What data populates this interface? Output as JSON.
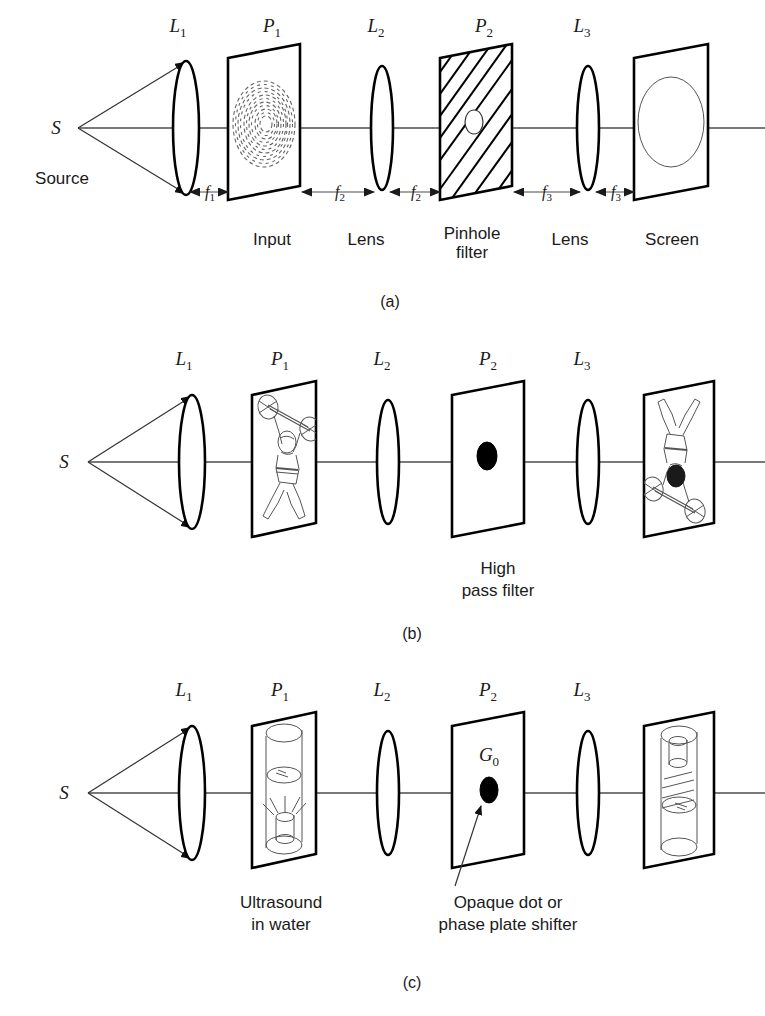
{
  "figure": {
    "background_color": "#ffffff",
    "ink_color": "#000000",
    "axis_color": "#4d4d4d"
  },
  "panels": [
    {
      "id": "a",
      "caption": "(a)",
      "source_label": "S",
      "source_name": "Source",
      "top_labels": [
        {
          "base": "L",
          "sub": "1"
        },
        {
          "base": "P",
          "sub": "1"
        },
        {
          "base": "L",
          "sub": "2"
        },
        {
          "base": "P",
          "sub": "2"
        },
        {
          "base": "L",
          "sub": "3"
        }
      ],
      "bottom_labels": [
        "Input",
        "Lens",
        "Pinhole filter",
        "Lens",
        "Screen"
      ],
      "distance_labels": [
        {
          "base": "f",
          "sub": "1"
        },
        {
          "base": "f",
          "sub": "2"
        },
        {
          "base": "f",
          "sub": "2"
        },
        {
          "base": "f",
          "sub": "3"
        },
        {
          "base": "f",
          "sub": "3"
        }
      ],
      "p1_content": "concentric-ring-fingerprint-pattern",
      "p2_content": "hatched-opaque-plate-with-central-pinhole",
      "screen_content": "large-open-ellipse"
    },
    {
      "id": "b",
      "caption": "(b)",
      "source_label": "S",
      "top_labels": [
        {
          "base": "L",
          "sub": "1"
        },
        {
          "base": "P",
          "sub": "1"
        },
        {
          "base": "L",
          "sub": "2"
        },
        {
          "base": "P",
          "sub": "2"
        },
        {
          "base": "L",
          "sub": "3"
        }
      ],
      "filter_label_lines": [
        "High",
        "pass filter"
      ],
      "p1_content": "weightlifter-figure-upright",
      "p2_content": "opaque-central-dot",
      "screen_content": "weightlifter-figure-inverted"
    },
    {
      "id": "c",
      "caption": "(c)",
      "source_label": "S",
      "top_labels": [
        {
          "base": "L",
          "sub": "1"
        },
        {
          "base": "P",
          "sub": "1"
        },
        {
          "base": "L",
          "sub": "2"
        },
        {
          "base": "P",
          "sub": "2"
        },
        {
          "base": "L",
          "sub": "3"
        }
      ],
      "input_label_lines": [
        "Ultrasound",
        "in water"
      ],
      "filter_label_lines": [
        "Opaque dot or",
        "phase plate shifter"
      ],
      "dot_label": {
        "base": "G",
        "sub": "0"
      },
      "p1_content": "beaker-of-water-with-ultrasound-transducer",
      "p2_content": "opaque-dot-G0",
      "screen_content": "inverted-beaker-with-wave-fringes"
    }
  ]
}
